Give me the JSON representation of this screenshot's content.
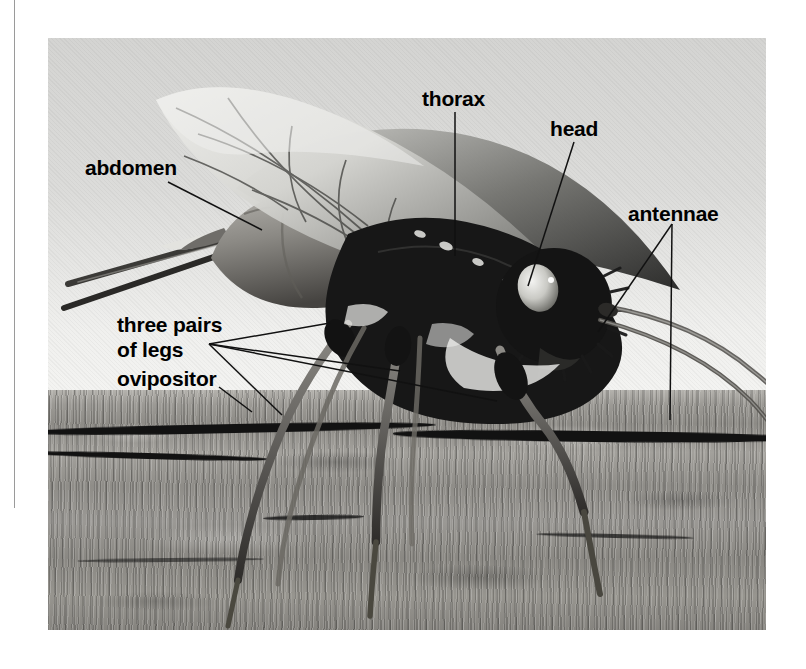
{
  "figure": {
    "type": "labeled photograph",
    "photo": {
      "left": 48,
      "top": 38,
      "width": 718,
      "height": 592,
      "background_description": "pale gray sky above rough gray tree bark"
    },
    "colors": {
      "label_text": "#000000",
      "leader_line": "#111111",
      "page_rule": "#9a9a9a",
      "page_background": "#ffffff",
      "sky_light": "#f4f4f2",
      "sky_dark": "#d4d4d2",
      "bark_mid": "#97958f",
      "bark_dark": "#121212",
      "insect_body": "#171717",
      "wing_light": "#d9d9d6"
    }
  },
  "labels": [
    {
      "id": "abdomen",
      "text": "abdomen",
      "x": 85,
      "y": 155,
      "leader": {
        "from": [
          168,
          182
        ],
        "to": [
          262,
          230
        ]
      }
    },
    {
      "id": "thorax",
      "text": "thorax",
      "x": 422,
      "y": 86,
      "leader": {
        "from": [
          455,
          112
        ],
        "to": [
          455,
          256
        ]
      }
    },
    {
      "id": "head",
      "text": "head",
      "x": 550,
      "y": 116,
      "leader": {
        "from": [
          574,
          142
        ],
        "to": [
          528,
          286
        ]
      }
    },
    {
      "id": "antennae",
      "text": "antennae",
      "x": 628,
      "y": 201,
      "leaders": [
        {
          "from": [
            672,
            224
          ],
          "to": [
            598,
            332
          ]
        },
        {
          "from": [
            672,
            224
          ],
          "to": [
            670,
            420
          ]
        }
      ]
    },
    {
      "id": "three-pairs-of-legs",
      "text": "three pairs\nof legs",
      "line1": "three pairs",
      "line2": "of legs",
      "x": 117,
      "y": 312,
      "leaders": [
        {
          "from": [
            209,
            344
          ],
          "to": [
            330,
            323
          ]
        },
        {
          "from": [
            209,
            344
          ],
          "to": [
            400,
            371
          ]
        },
        {
          "from": [
            209,
            344
          ],
          "to": [
            497,
            401
          ]
        },
        {
          "from": [
            209,
            344
          ],
          "to": [
            282,
            415
          ]
        }
      ]
    },
    {
      "id": "ovipositor",
      "text": "ovipositor",
      "x": 117,
      "y": 366,
      "leader": {
        "from": [
          219,
          387
        ],
        "to": [
          252,
          412
        ]
      }
    }
  ],
  "page_rule": {
    "x": 14,
    "top": 0,
    "height": 508
  }
}
